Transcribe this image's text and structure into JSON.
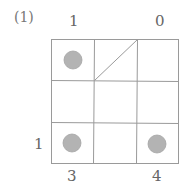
{
  "problem": {
    "number": "(1)"
  },
  "grid": {
    "rows": 3,
    "cols": 3,
    "circle_color": "#b3b3b3",
    "line_color": "#999999",
    "circles": [
      {
        "row": 0,
        "col": 0
      },
      {
        "row": 2,
        "col": 0
      },
      {
        "row": 2,
        "col": 2
      }
    ],
    "diagonal": {
      "row": 0,
      "col": 1,
      "direction": "bottom-left-to-top-right"
    }
  },
  "clues": {
    "top": [
      {
        "col": 0,
        "value": "1"
      },
      {
        "col": 2,
        "value": "0"
      }
    ],
    "bottom": [
      {
        "col": 0,
        "value": "3"
      },
      {
        "col": 2,
        "value": "4"
      }
    ],
    "left": [
      {
        "row": 2,
        "value": "1"
      }
    ]
  }
}
